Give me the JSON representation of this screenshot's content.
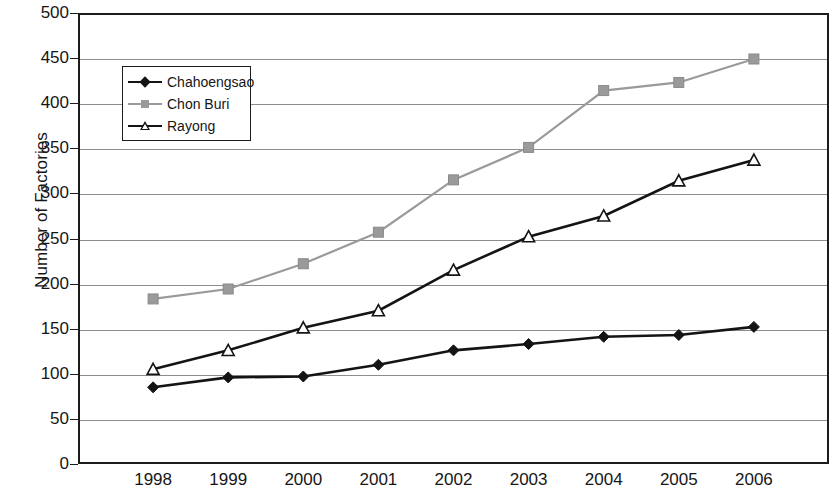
{
  "chart_data": {
    "type": "line",
    "title": "",
    "xlabel": "",
    "ylabel": "Number of Factories",
    "categories": [
      "1998",
      "1999",
      "2000",
      "2001",
      "2002",
      "2003",
      "2004",
      "2005",
      "2006"
    ],
    "ylim": [
      0,
      500
    ],
    "ytick_step": 50,
    "yticks": [
      "500",
      "450",
      "400",
      "350",
      "300",
      "250",
      "200",
      "150",
      "100",
      "50",
      "0"
    ],
    "grid": true,
    "legend_position": "upper-left-inside",
    "series": [
      {
        "name": "Chahoengsao",
        "marker": "diamond-filled",
        "color": "#141414",
        "values": [
          85,
          96,
          97,
          110,
          126,
          133,
          141,
          143,
          152
        ]
      },
      {
        "name": "Chon Buri",
        "marker": "square-filled",
        "color": "#9a9a9a",
        "values": [
          183,
          194,
          222,
          257,
          315,
          351,
          414,
          423,
          449
        ]
      },
      {
        "name": "Rayong",
        "marker": "triangle-hollow",
        "color": "#141414",
        "values": [
          105,
          126,
          151,
          170,
          215,
          252,
          275,
          314,
          337
        ]
      }
    ]
  },
  "legend": {
    "items": [
      {
        "label": "Chahoengsao",
        "marker": "diamond-filled",
        "color": "#141414"
      },
      {
        "label": "Chon Buri",
        "marker": "square-filled",
        "color": "#9a9a9a"
      },
      {
        "label": "Rayong",
        "marker": "triangle-hollow",
        "color": "#141414"
      }
    ]
  },
  "colors": {
    "axis": "#1c1c1c",
    "grid": "#8d8d8d",
    "series_dark": "#141414",
    "series_gray": "#9a9a9a",
    "background": "#ffffff"
  }
}
